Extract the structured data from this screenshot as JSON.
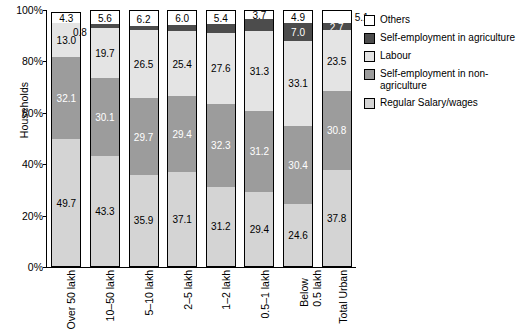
{
  "chart_data": {
    "type": "bar",
    "stacked": true,
    "title": "",
    "xlabel": "",
    "ylabel": "Households",
    "ylim": [
      0,
      100
    ],
    "yticks": [
      "0%",
      "20%",
      "40%",
      "60%",
      "80%",
      "100%"
    ],
    "grid": false,
    "legend_position": "right",
    "categories": [
      "Over 50 lakh",
      "10–50 lakh",
      "5–10 lakh",
      "2–5 lakh",
      "1–2 lakh",
      "0.5–1 lakh",
      "Below 0.5 lakh",
      "Total Urban"
    ],
    "series": [
      {
        "name": "Regular Salary/wages",
        "color": "#d4d4d4",
        "values": [
          49.7,
          43.3,
          35.9,
          37.1,
          31.2,
          29.4,
          24.6,
          37.8
        ]
      },
      {
        "name": "Self-employment in non-agriculture",
        "color": "#9c9c9c",
        "values": [
          32.1,
          30.1,
          29.7,
          29.4,
          32.3,
          31.2,
          30.4,
          30.8
        ]
      },
      {
        "name": "Labour",
        "color": "#e4e4e4",
        "values": [
          13.0,
          19.7,
          26.5,
          25.4,
          27.6,
          31.3,
          33.1,
          23.5
        ]
      },
      {
        "name": "Self-employment in agriculture",
        "color": "#4c4c4c",
        "values": [
          0.0,
          1.3,
          1.6,
          2.2,
          3.4,
          4.5,
          7.0,
          2.7
        ]
      },
      {
        "name": "Others",
        "color": "#ffffff",
        "values": [
          4.3,
          5.6,
          6.2,
          6.0,
          5.4,
          3.7,
          4.9,
          5.1
        ]
      }
    ],
    "extra_labels": [
      {
        "category": "10–50 lakh",
        "value": "0.8",
        "note": "small segment label at top of second bar"
      }
    ]
  },
  "legend": {
    "items": [
      {
        "label": "Others",
        "color": "#ffffff"
      },
      {
        "label": "Self-employment in agriculture",
        "color": "#4c4c4c"
      },
      {
        "label": "Labour",
        "color": "#e4e4e4"
      },
      {
        "label": "Self-employment in non-agriculture",
        "color": "#9c9c9c"
      },
      {
        "label": "Regular Salary/wages",
        "color": "#d4d4d4"
      }
    ]
  }
}
